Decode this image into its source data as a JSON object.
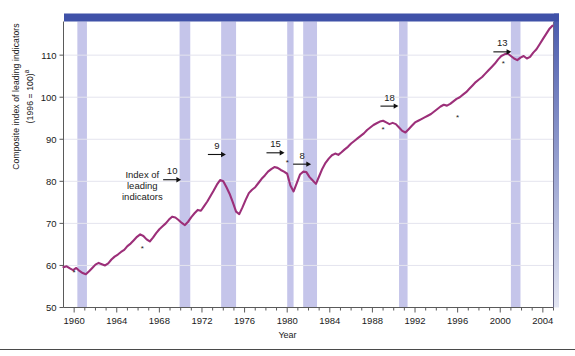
{
  "figure": {
    "ylabel_line1": "Composite index of leading indicators",
    "ylabel_line2": "(1996 = 100)",
    "ylabel_sup": "a",
    "xlabel": "Year",
    "series_label_l1": "Index of",
    "series_label_l2": "leading",
    "series_label_l3": "indicators",
    "line_color": "#9c2f79",
    "band_color": "#c5c5ea",
    "top_bar_color": "#3f51a8",
    "grid_color": "#e4e4ee"
  },
  "chart_data": {
    "type": "line",
    "title": "",
    "xlabel": "Year",
    "ylabel": "Composite index of leading indicators (1996 = 100)",
    "xlim": [
      1959,
      2005
    ],
    "ylim": [
      50,
      118
    ],
    "yticks": [
      50,
      60,
      70,
      80,
      90,
      100,
      110
    ],
    "xticks": [
      1960,
      1964,
      1968,
      1972,
      1976,
      1980,
      1984,
      1988,
      1992,
      1996,
      2000,
      2004
    ],
    "grid": "horizontal",
    "legend": "none",
    "series": [
      {
        "name": "Index of leading indicators",
        "color": "#9c2f79",
        "x": [
          1959.0,
          1959.3,
          1959.6,
          1959.9,
          1960.2,
          1960.5,
          1960.8,
          1961.1,
          1961.4,
          1961.7,
          1962.0,
          1962.3,
          1962.6,
          1962.9,
          1963.2,
          1963.5,
          1963.8,
          1964.1,
          1964.4,
          1964.7,
          1965.0,
          1965.3,
          1965.6,
          1965.9,
          1966.2,
          1966.5,
          1966.8,
          1967.1,
          1967.4,
          1967.7,
          1968.0,
          1968.3,
          1968.6,
          1968.9,
          1969.2,
          1969.5,
          1969.8,
          1970.1,
          1970.4,
          1970.7,
          1971.0,
          1971.3,
          1971.6,
          1971.9,
          1972.2,
          1972.5,
          1972.8,
          1973.1,
          1973.4,
          1973.7,
          1974.0,
          1974.3,
          1974.6,
          1974.9,
          1975.2,
          1975.5,
          1975.8,
          1976.1,
          1976.4,
          1976.7,
          1977.0,
          1977.3,
          1977.6,
          1977.9,
          1978.2,
          1978.5,
          1978.8,
          1979.1,
          1979.4,
          1979.7,
          1980.0,
          1980.3,
          1980.6,
          1980.9,
          1981.2,
          1981.5,
          1981.8,
          1982.1,
          1982.4,
          1982.7,
          1983.0,
          1983.3,
          1983.6,
          1983.9,
          1984.2,
          1984.5,
          1984.8,
          1985.1,
          1985.4,
          1985.7,
          1986.0,
          1986.3,
          1986.6,
          1986.9,
          1987.2,
          1987.5,
          1987.8,
          1988.1,
          1988.4,
          1988.7,
          1989.0,
          1989.3,
          1989.6,
          1989.9,
          1990.2,
          1990.5,
          1990.8,
          1991.1,
          1991.4,
          1991.7,
          1992.0,
          1992.3,
          1992.6,
          1992.9,
          1993.2,
          1993.5,
          1993.8,
          1994.1,
          1994.4,
          1994.7,
          1995.0,
          1995.3,
          1995.6,
          1995.9,
          1996.2,
          1996.5,
          1996.8,
          1997.1,
          1997.4,
          1997.7,
          1998.0,
          1998.3,
          1998.6,
          1998.9,
          1999.2,
          1999.5,
          1999.8,
          2000.1,
          2000.4,
          2000.7,
          2001.0,
          2001.3,
          2001.6,
          2001.9,
          2002.2,
          2002.5,
          2002.8,
          2003.1,
          2003.4,
          2003.7,
          2004.0,
          2004.3,
          2004.6,
          2004.9
        ],
        "y": [
          59.6,
          59.8,
          59.3,
          58.9,
          59.4,
          58.7,
          58.2,
          57.9,
          58.6,
          59.4,
          60.2,
          60.6,
          60.3,
          60.0,
          60.5,
          61.4,
          62.1,
          62.6,
          63.2,
          63.7,
          64.6,
          65.2,
          66.0,
          66.8,
          67.4,
          67.0,
          66.2,
          65.7,
          66.6,
          67.7,
          68.6,
          69.3,
          70.0,
          70.9,
          71.6,
          71.4,
          70.8,
          70.1,
          69.6,
          70.4,
          71.5,
          72.4,
          73.2,
          73.0,
          74.1,
          75.2,
          76.5,
          77.8,
          79.2,
          80.3,
          80.0,
          78.6,
          77.0,
          75.0,
          72.8,
          72.2,
          73.8,
          75.6,
          77.2,
          78.0,
          78.6,
          79.6,
          80.6,
          81.4,
          82.3,
          82.9,
          83.4,
          83.2,
          82.7,
          82.3,
          81.8,
          79.0,
          77.6,
          79.6,
          81.6,
          82.3,
          82.2,
          81.0,
          80.2,
          79.4,
          81.2,
          83.0,
          84.4,
          85.4,
          86.2,
          86.6,
          86.3,
          86.9,
          87.6,
          88.2,
          89.0,
          89.6,
          90.2,
          90.8,
          91.4,
          92.2,
          92.8,
          93.4,
          93.8,
          94.2,
          94.4,
          94.0,
          93.6,
          93.9,
          93.6,
          92.8,
          92.0,
          91.6,
          92.4,
          93.2,
          94.0,
          94.4,
          94.8,
          95.2,
          95.6,
          96.0,
          96.6,
          97.2,
          97.8,
          98.2,
          98.0,
          98.4,
          99.0,
          99.6,
          100.0,
          100.6,
          101.2,
          102.0,
          102.8,
          103.6,
          104.2,
          104.8,
          105.6,
          106.4,
          107.2,
          108.0,
          109.0,
          109.8,
          110.2,
          110.4,
          109.8,
          109.2,
          108.8,
          109.4,
          109.8,
          109.2,
          109.6,
          110.6,
          111.4,
          112.6,
          113.8,
          115.0,
          116.2,
          117.0
        ],
        "peak_markers": [
          {
            "x": 1960.0,
            "y": 58.2
          },
          {
            "x": 1966.4,
            "y": 64.0
          },
          {
            "x": 1980.0,
            "y": 84.4
          },
          {
            "x": 1989.0,
            "y": 92.3
          },
          {
            "x": 1996.0,
            "y": 95.0
          },
          {
            "x": 2000.3,
            "y": 107.8
          }
        ]
      }
    ],
    "annotations": [
      {
        "label": "10",
        "x": 1969.2,
        "y": 80.5,
        "arrow": "right"
      },
      {
        "label": "9",
        "x": 1973.4,
        "y": 86.5,
        "arrow": "right"
      },
      {
        "label": "15",
        "x": 1978.9,
        "y": 86.9,
        "arrow": "right"
      },
      {
        "label": "8",
        "x": 1981.4,
        "y": 84.2,
        "arrow": "right"
      },
      {
        "label": "18",
        "x": 1989.6,
        "y": 98.0,
        "arrow": "right"
      },
      {
        "label": "13",
        "x": 2000.2,
        "y": 110.9,
        "arrow": "right"
      }
    ],
    "recession_bands": [
      {
        "start": 1960.3,
        "end": 1961.2
      },
      {
        "start": 1969.9,
        "end": 1970.9
      },
      {
        "start": 1973.8,
        "end": 1975.2
      },
      {
        "start": 1980.0,
        "end": 1980.6
      },
      {
        "start": 1981.5,
        "end": 1982.8
      },
      {
        "start": 1990.5,
        "end": 1991.3
      },
      {
        "start": 2001.0,
        "end": 2001.9
      }
    ],
    "inline_label": "Index of leading indicators"
  }
}
